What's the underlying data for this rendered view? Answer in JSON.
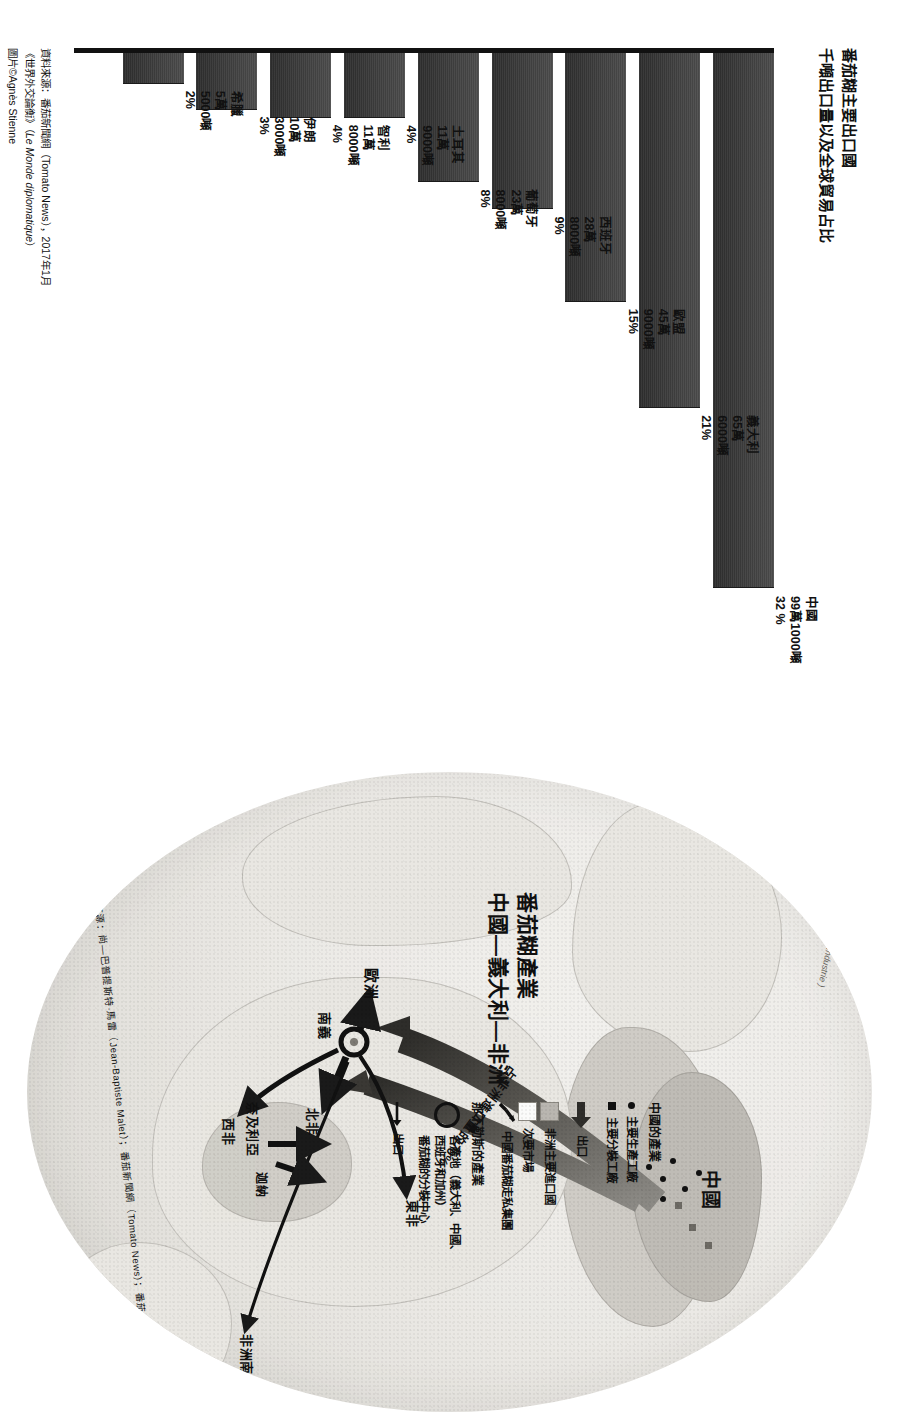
{
  "chart": {
    "title_line1": "番茄糊主要出口國",
    "title_line2": "千噸出口量以及全球貿易占比",
    "source_line1": "資料來源：番茄新聞網（Tomato News），2017年1月",
    "source_line2_a": "《世界外交論衡》（",
    "source_line2_it": "Le Monde diplomatique",
    "source_line2_b": "）",
    "source_line3": "圖片©Agnès Stienne"
  },
  "chart_data": {
    "type": "bar",
    "title": "番茄糊主要出口國 千噸出口量以及全球貿易占比",
    "xlabel": "",
    "ylabel": "",
    "orientation": "horizontal",
    "categories": [
      "中國",
      "義大利",
      "歐盟",
      "西班牙",
      "葡萄牙",
      "土耳其",
      "智利",
      "伊朗",
      "希臘"
    ],
    "values": [
      990000,
      656000,
      459000,
      288000,
      238000,
      119000,
      118000,
      103000,
      55000
    ],
    "percents": [
      32,
      21,
      15,
      9,
      8,
      4,
      4,
      3,
      2
    ],
    "bars": [
      {
        "name": "中國",
        "amount_line1": "99萬1000噸",
        "amount_line2": "",
        "percent": "32 %",
        "value": 991000,
        "share": 32
      },
      {
        "name": "義大利",
        "amount_line1": "65萬",
        "amount_line2": "6000噸",
        "percent": "21%",
        "value": 656000,
        "share": 21
      },
      {
        "name": "歐盟",
        "amount_line1": "45萬",
        "amount_line2": "9000噸",
        "percent": "15%",
        "value": 459000,
        "share": 15
      },
      {
        "name": "西班牙",
        "amount_line1": "28萬",
        "amount_line2": "8000噸",
        "percent": "9%",
        "value": 288000,
        "share": 9
      },
      {
        "name": "葡萄牙",
        "amount_line1": "23萬",
        "amount_line2": "8000噸",
        "percent": "8%",
        "value": 238000,
        "share": 8
      },
      {
        "name": "土耳其",
        "amount_line1": "11萬",
        "amount_line2": "9000噸",
        "percent": "4%",
        "value": 119000,
        "share": 4
      },
      {
        "name": "智利",
        "amount_line1": "11萬",
        "amount_line2": "8000噸",
        "percent": "4%",
        "value": 118000,
        "share": 4
      },
      {
        "name": "伊朗",
        "amount_line1": "10萬",
        "amount_line2": "3000噸",
        "percent": "3%",
        "value": 103000,
        "share": 3
      },
      {
        "name": "希臘",
        "amount_line1": "5萬",
        "amount_line2": "5000噸",
        "percent": "2%",
        "value": 55000,
        "share": 2
      }
    ]
  },
  "map": {
    "title_line1": "番茄糊產業",
    "title_line2": "中國—義大利—非洲",
    "flow_label": "占非洲進口量的70%",
    "places": {
      "china": "中國",
      "europe": "歐洲",
      "south_italy": "南義",
      "north_africa": "北非",
      "west_africa": "西非",
      "east_africa": "東非",
      "southern_africa": "非洲南部",
      "nigeria": "奈及利亞",
      "ghana": "迦納"
    },
    "legend": {
      "china_industry_header": "中國的產業",
      "china_main_factory": "主要生產工廠",
      "china_pack_factory": "主要分裝工廠",
      "export": "出口",
      "africa_main_import": "非洲主要進口國",
      "secondary_market": "次要市場",
      "smuggling": "中國番茄糊走私集團",
      "naples_header": "那不勒斯的產業",
      "origin_line1": "各產地（義大利、中國、",
      "origin_line2": "西班牙和加州）",
      "origin_line3": "番茄糊的分裝中心",
      "export2": "出口"
    },
    "source": "資料來源：尚—巴普提斯特·馬雷（Jean-Baptiste Malet）；番茄新聞網（Tomato News）；番茄產業全球資訊中心（Centre Mondial d'Information sur la Tomate d'Industrie）"
  }
}
